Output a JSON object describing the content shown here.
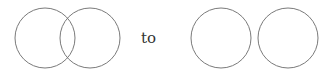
{
  "diagram": {
    "connector_text": "to",
    "stroke_color": "#7a7a7a",
    "before": {
      "circles": [
        {
          "cx": 45,
          "cy": 38,
          "r": 30
        },
        {
          "cx": 90,
          "cy": 38,
          "r": 30
        }
      ]
    },
    "after": {
      "circles": [
        {
          "cx": 221,
          "cy": 38,
          "r": 30
        },
        {
          "cx": 288,
          "cy": 38,
          "r": 30
        }
      ]
    }
  }
}
